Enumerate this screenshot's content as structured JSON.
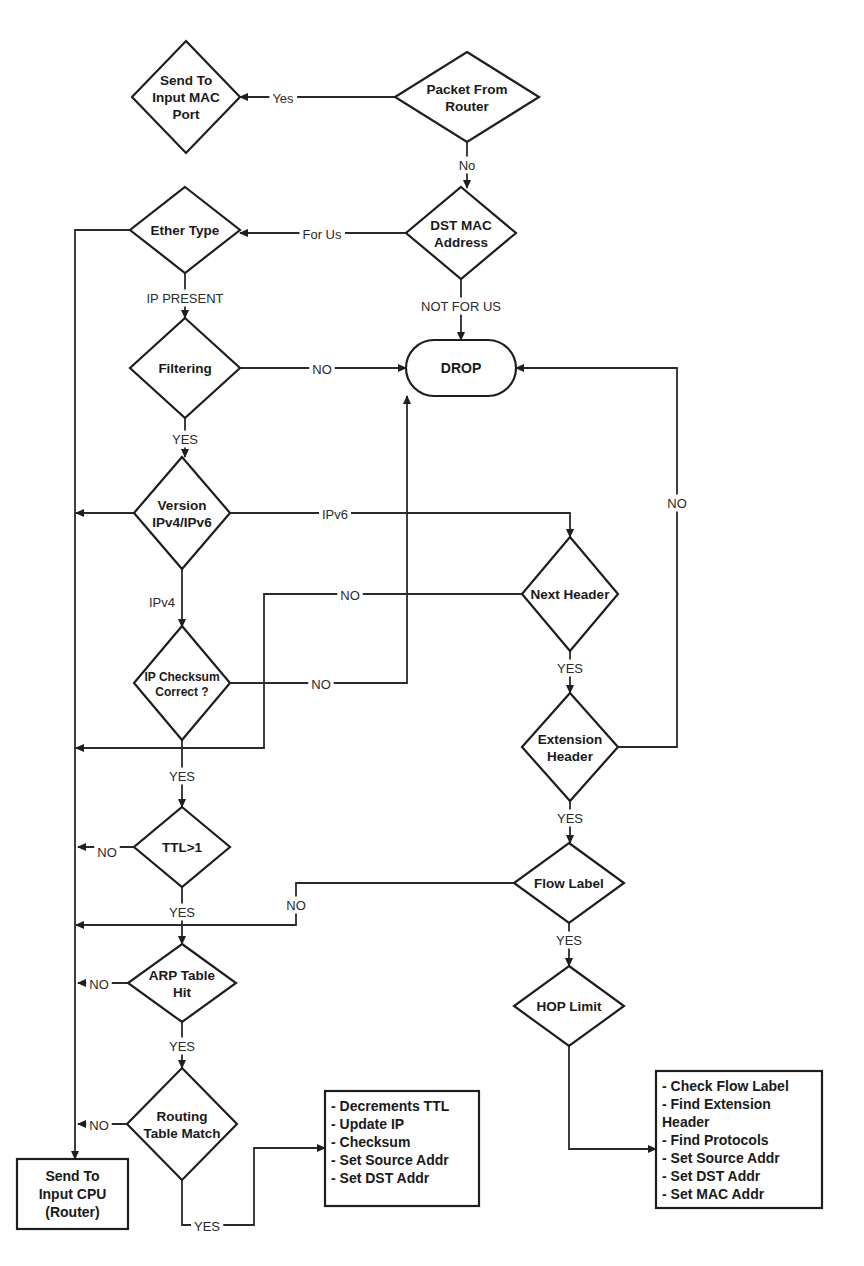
{
  "diagram": {
    "type": "flowchart",
    "colors": {
      "stroke": "#1e1e1e",
      "text": "#1a1a1a",
      "background": "#ffffff"
    },
    "nodes": [
      {
        "id": "packet_from_router",
        "shape": "diamond",
        "cx": 467,
        "cy": 97,
        "w": 144,
        "h": 90,
        "lines": [
          "Packet From",
          "Router"
        ]
      },
      {
        "id": "send_to_input_mac_port",
        "shape": "diamond",
        "cx": 186,
        "cy": 97,
        "w": 108,
        "h": 112,
        "lines": [
          "Send To",
          "Input MAC",
          "Port"
        ]
      },
      {
        "id": "dst_mac_address",
        "shape": "diamond",
        "cx": 461,
        "cy": 233,
        "w": 110,
        "h": 92,
        "lines": [
          "DST MAC",
          "Address"
        ]
      },
      {
        "id": "ether_type",
        "shape": "diamond",
        "cx": 185,
        "cy": 230,
        "w": 110,
        "h": 86,
        "lines": [
          "Ether Type"
        ]
      },
      {
        "id": "filtering",
        "shape": "diamond",
        "cx": 185,
        "cy": 368,
        "w": 110,
        "h": 100,
        "lines": [
          "Filtering"
        ]
      },
      {
        "id": "drop",
        "shape": "terminal",
        "cx": 461,
        "cy": 368,
        "w": 110,
        "h": 56,
        "lines": [
          "DROP"
        ]
      },
      {
        "id": "version",
        "shape": "diamond",
        "cx": 182,
        "cy": 513,
        "w": 96,
        "h": 112,
        "lines": [
          "Version",
          "IPv4/IPv6"
        ]
      },
      {
        "id": "next_header",
        "shape": "diamond",
        "cx": 570,
        "cy": 594,
        "w": 96,
        "h": 114,
        "lines": [
          "Next Header"
        ]
      },
      {
        "id": "ip_checksum",
        "shape": "diamond",
        "cx": 182,
        "cy": 683,
        "w": 96,
        "h": 114,
        "lines": [
          "IP Checksum",
          "Correct ?"
        ],
        "small": true
      },
      {
        "id": "extension_header",
        "shape": "diamond",
        "cx": 570,
        "cy": 747,
        "w": 96,
        "h": 108,
        "lines": [
          "Extension",
          "Header"
        ]
      },
      {
        "id": "ttl",
        "shape": "diamond",
        "cx": 182,
        "cy": 847,
        "w": 96,
        "h": 80,
        "lines": [
          "TTL>1"
        ]
      },
      {
        "id": "flow_label",
        "shape": "diamond",
        "cx": 569,
        "cy": 883,
        "w": 110,
        "h": 80,
        "lines": [
          "Flow Label"
        ]
      },
      {
        "id": "arp_table_hit",
        "shape": "diamond",
        "cx": 182,
        "cy": 983,
        "w": 108,
        "h": 78,
        "lines": [
          "ARP Table",
          "Hit"
        ]
      },
      {
        "id": "hop_limit",
        "shape": "diamond",
        "cx": 569,
        "cy": 1006,
        "w": 110,
        "h": 80,
        "lines": [
          "HOP Limit"
        ]
      },
      {
        "id": "routing_table_match",
        "shape": "diamond",
        "cx": 182,
        "cy": 1124,
        "w": 110,
        "h": 112,
        "lines": [
          "Routing",
          "Table Match"
        ]
      },
      {
        "id": "send_to_input_cpu",
        "shape": "box",
        "x": 17,
        "y": 1159,
        "w": 111,
        "h": 70,
        "center": true,
        "lines": [
          "Send To",
          "Input CPU",
          "(Router)"
        ]
      },
      {
        "id": "ipv4_actions",
        "shape": "box",
        "x": 325,
        "y": 1091,
        "w": 154,
        "h": 115,
        "lines": [
          "- Decrements TTL",
          "- Update IP",
          "- Checksum",
          "- Set Source Addr",
          "- Set DST Addr"
        ]
      },
      {
        "id": "ipv6_actions",
        "shape": "box",
        "x": 656,
        "y": 1071,
        "w": 166,
        "h": 137,
        "lines": [
          "- Check Flow Label",
          "- Find Extension",
          "Header",
          "- Find Protocols",
          "- Set Source Addr",
          "- Set DST Addr",
          "- Set MAC Addr"
        ]
      }
    ],
    "edges": [
      {
        "id": "router_yes",
        "points": [
          [
            395,
            97
          ],
          [
            240,
            97
          ]
        ],
        "arrow": true,
        "label": "Yes",
        "lx": 283,
        "ly": 98
      },
      {
        "id": "router_no",
        "points": [
          [
            467,
            142
          ],
          [
            467,
            188
          ]
        ],
        "arrow": true,
        "label": "No",
        "lx": 467,
        "ly": 165
      },
      {
        "id": "dst_for_us",
        "points": [
          [
            406,
            233
          ],
          [
            240,
            233
          ]
        ],
        "arrow": true,
        "label": "For Us",
        "lx": 322,
        "ly": 234
      },
      {
        "id": "dst_not_for_us",
        "points": [
          [
            461,
            279
          ],
          [
            461,
            340
          ]
        ],
        "arrow": true,
        "label": "NOT FOR US",
        "lx": 461,
        "ly": 306
      },
      {
        "id": "ether_ip_present",
        "points": [
          [
            185,
            273
          ],
          [
            185,
            318
          ]
        ],
        "arrow": true,
        "label": "IP PRESENT",
        "lx": 185,
        "ly": 298
      },
      {
        "id": "ether_other",
        "points": [
          [
            130,
            230
          ],
          [
            75,
            230
          ],
          [
            75,
            1159
          ]
        ],
        "arrow": true
      },
      {
        "id": "filtering_no",
        "points": [
          [
            240,
            368
          ],
          [
            406,
            368
          ]
        ],
        "arrow": true,
        "label": "NO",
        "lx": 322,
        "ly": 369
      },
      {
        "id": "filtering_yes",
        "points": [
          [
            185,
            418
          ],
          [
            185,
            457
          ]
        ],
        "arrow": true,
        "label": "YES",
        "lx": 185,
        "ly": 439
      },
      {
        "id": "version_other",
        "points": [
          [
            134,
            513
          ],
          [
            76,
            513
          ]
        ],
        "arrow": true
      },
      {
        "id": "version_ipv6",
        "points": [
          [
            230,
            513
          ],
          [
            570,
            513
          ],
          [
            570,
            537
          ]
        ],
        "arrow": true,
        "label": "IPv6",
        "lx": 335,
        "ly": 514
      },
      {
        "id": "version_ipv4",
        "points": [
          [
            182,
            569
          ],
          [
            182,
            627
          ]
        ],
        "arrow": true,
        "label": "IPv4",
        "lx": 162,
        "ly": 602
      },
      {
        "id": "next_header_no",
        "points": [
          [
            522,
            594
          ],
          [
            264,
            594
          ],
          [
            264,
            748
          ],
          [
            76,
            748
          ]
        ],
        "arrow": true,
        "label": "NO",
        "lx": 350,
        "ly": 595
      },
      {
        "id": "ip_checksum_no",
        "points": [
          [
            230,
            683
          ],
          [
            407,
            683
          ],
          [
            407,
            396
          ]
        ],
        "arrow": true,
        "label": "NO",
        "lx": 321,
        "ly": 684
      },
      {
        "id": "ip_checksum_yes",
        "points": [
          [
            182,
            740
          ],
          [
            182,
            807
          ]
        ],
        "arrow": true,
        "label": "YES",
        "lx": 182,
        "ly": 776
      },
      {
        "id": "next_header_yes",
        "points": [
          [
            570,
            651
          ],
          [
            570,
            693
          ]
        ],
        "arrow": true,
        "label": "YES",
        "lx": 570,
        "ly": 668
      },
      {
        "id": "extension_no",
        "points": [
          [
            618,
            747
          ],
          [
            677,
            747
          ],
          [
            677,
            368
          ],
          [
            516,
            368
          ]
        ],
        "arrow": true,
        "label": "NO",
        "lx": 677,
        "ly": 503
      },
      {
        "id": "extension_yes",
        "points": [
          [
            570,
            801
          ],
          [
            570,
            843
          ]
        ],
        "arrow": true,
        "label": "YES",
        "lx": 570,
        "ly": 818
      },
      {
        "id": "ttl_no",
        "points": [
          [
            134,
            847
          ],
          [
            78,
            847
          ]
        ],
        "arrow": true,
        "label": "NO",
        "lx": 107,
        "ly": 852
      },
      {
        "id": "ttl_yes",
        "points": [
          [
            182,
            887
          ],
          [
            182,
            944
          ]
        ],
        "arrow": true,
        "label": "YES",
        "lx": 182,
        "ly": 912
      },
      {
        "id": "flow_label_no",
        "points": [
          [
            514,
            883
          ],
          [
            296,
            883
          ],
          [
            296,
            925
          ],
          [
            76,
            925
          ]
        ],
        "arrow": true,
        "label": "NO",
        "lx": 296,
        "ly": 905
      },
      {
        "id": "flow_label_yes",
        "points": [
          [
            569,
            923
          ],
          [
            569,
            966
          ]
        ],
        "arrow": true,
        "label": "YES",
        "lx": 569,
        "ly": 940
      },
      {
        "id": "arp_no",
        "points": [
          [
            128,
            983
          ],
          [
            78,
            983
          ]
        ],
        "arrow": true,
        "label": "NO",
        "lx": 99,
        "ly": 984
      },
      {
        "id": "arp_yes",
        "points": [
          [
            182,
            1022
          ],
          [
            182,
            1068
          ]
        ],
        "arrow": true,
        "label": "YES",
        "lx": 182,
        "ly": 1046
      },
      {
        "id": "routing_no",
        "points": [
          [
            127,
            1124
          ],
          [
            78,
            1124
          ]
        ],
        "arrow": true,
        "label": "NO",
        "lx": 99,
        "ly": 1125
      },
      {
        "id": "routing_yes",
        "points": [
          [
            182,
            1180
          ],
          [
            182,
            1225
          ],
          [
            254,
            1225
          ],
          [
            254,
            1148
          ],
          [
            325,
            1148
          ]
        ],
        "arrow": true,
        "label": "YES",
        "lx": 207,
        "ly": 1226
      },
      {
        "id": "hop_limit_out",
        "points": [
          [
            569,
            1046
          ],
          [
            569,
            1149
          ],
          [
            656,
            1149
          ]
        ],
        "arrow": true
      }
    ]
  }
}
